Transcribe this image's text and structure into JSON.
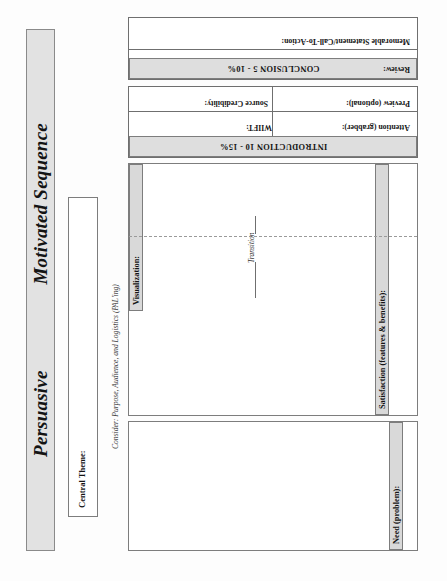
{
  "document": {
    "title_left": "Persuasive",
    "title_right": "Motivated Sequence",
    "pal_note": "Consider: Purpose, Audience, and Logistics (PAL'ing)"
  },
  "theme": {
    "label": "Central Theme:"
  },
  "body_sections": [
    {
      "key": "need",
      "label": "Need (problem):"
    },
    {
      "key": "satisfaction",
      "label": "Satisfaction (features & benefits):"
    },
    {
      "key": "visualization",
      "label": "Visualization:"
    }
  ],
  "transition": {
    "label": "Transition"
  },
  "introduction": {
    "header": "INTRODUCTION 10 - 15%",
    "fields": [
      {
        "key": "attention",
        "label": "Attention (grabber):"
      },
      {
        "key": "wiift",
        "label": "WIIFT:"
      },
      {
        "key": "source",
        "label": "Source Credibility:"
      },
      {
        "key": "preview",
        "label": "Preview (optional):"
      }
    ]
  },
  "conclusion": {
    "header": "CONCLUSION 5 - 10%",
    "fields": [
      {
        "key": "review",
        "label": "Review:"
      },
      {
        "key": "memorable",
        "label": "Memorable Statement/Call-To-Action:"
      }
    ]
  },
  "colors": {
    "banner_fill": "#e2e2e2",
    "tab_fill": "#d9d9d9",
    "header_fill": "#dedede",
    "rule": "#7d7d7d",
    "paper": "#fdfdfd",
    "ink": "#141414"
  }
}
